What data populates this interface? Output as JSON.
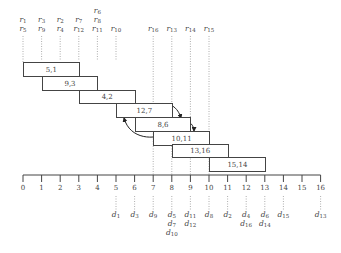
{
  "diagram": {
    "axis": {
      "ticks": [
        "0",
        "1",
        "2",
        "3",
        "4",
        "5",
        "6",
        "7",
        "8",
        "9",
        "10",
        "11",
        "12",
        "13",
        "14",
        "15",
        "16"
      ],
      "x0": 23,
      "spacing": 18.6,
      "y": 175
    },
    "top_labels": [
      {
        "tick": 0,
        "lines": [
          [
            "r",
            "1"
          ],
          [
            "r",
            "5"
          ]
        ]
      },
      {
        "tick": 1,
        "lines": [
          [
            "r",
            "3"
          ],
          [
            "r",
            "9"
          ]
        ]
      },
      {
        "tick": 2,
        "lines": [
          [
            "r",
            "2"
          ],
          [
            "r",
            "4"
          ]
        ]
      },
      {
        "tick": 3,
        "lines": [
          [
            "r",
            "7"
          ],
          [
            "r",
            "12"
          ]
        ]
      },
      {
        "tick": 4,
        "lines": [
          [
            "r",
            "6"
          ],
          [
            "r",
            "8"
          ],
          [
            "r",
            "11"
          ]
        ]
      },
      {
        "tick": 5,
        "lines": [
          [
            "r",
            "10"
          ]
        ]
      },
      {
        "tick": 7,
        "lines": [
          [
            "r",
            "16"
          ]
        ]
      },
      {
        "tick": 8,
        "lines": [
          [
            "r",
            "13"
          ]
        ]
      },
      {
        "tick": 9,
        "lines": [
          [
            "r",
            "14"
          ]
        ]
      },
      {
        "tick": 10,
        "lines": [
          [
            "r",
            "15"
          ]
        ]
      }
    ],
    "boxes": [
      {
        "label": "5,1",
        "start": 0,
        "end": 3,
        "top": 62,
        "height": 15
      },
      {
        "label": "9,3",
        "start": 1,
        "end": 4,
        "top": 76,
        "height": 15
      },
      {
        "label": "4,2",
        "start": 3,
        "end": 6,
        "top": 90,
        "height": 14
      },
      {
        "label": "12,7",
        "start": 5,
        "end": 8,
        "top": 103,
        "height": 15
      },
      {
        "label": "8,6",
        "start": 6,
        "end": 9,
        "top": 117,
        "height": 15
      },
      {
        "label": "10,11",
        "start": 7,
        "end": 10,
        "top": 131,
        "height": 15
      },
      {
        "label": "13,16",
        "start": 8,
        "end": 11,
        "top": 144,
        "height": 14
      },
      {
        "label": "15,14",
        "start": 10,
        "end": 13,
        "top": 157,
        "height": 15
      }
    ],
    "bottom_labels": [
      {
        "tick": 5,
        "lines": [
          [
            "d",
            "1"
          ]
        ]
      },
      {
        "tick": 6,
        "lines": [
          [
            "d",
            "3"
          ]
        ]
      },
      {
        "tick": 7,
        "lines": [
          [
            "d",
            "9"
          ]
        ]
      },
      {
        "tick": 8,
        "lines": [
          [
            "d",
            "5"
          ],
          [
            "d",
            "7"
          ],
          [
            "d",
            "10"
          ]
        ]
      },
      {
        "tick": 9,
        "lines": [
          [
            "d",
            "11"
          ],
          [
            "d",
            "12"
          ]
        ]
      },
      {
        "tick": 10,
        "lines": [
          [
            "d",
            "8"
          ]
        ]
      },
      {
        "tick": 11,
        "lines": [
          [
            "d",
            "2"
          ]
        ]
      },
      {
        "tick": 12,
        "lines": [
          [
            "d",
            "4"
          ],
          [
            "d",
            "16"
          ]
        ]
      },
      {
        "tick": 13,
        "lines": [
          [
            "d",
            "6"
          ],
          [
            "d",
            "14"
          ]
        ]
      },
      {
        "tick": 14,
        "lines": [
          [
            "d",
            "15"
          ]
        ]
      },
      {
        "tick": 16,
        "lines": [
          [
            "d",
            "13"
          ]
        ]
      }
    ],
    "colors": {
      "line": "#444444",
      "dotted": "#999999",
      "text": "#444444"
    }
  }
}
